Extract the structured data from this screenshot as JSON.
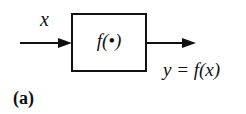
{
  "diagram": {
    "input_label": "x",
    "block_label": "f(•)",
    "output_label": "y = f(x)",
    "panel_label": "(a)",
    "line_color": "#111111"
  }
}
